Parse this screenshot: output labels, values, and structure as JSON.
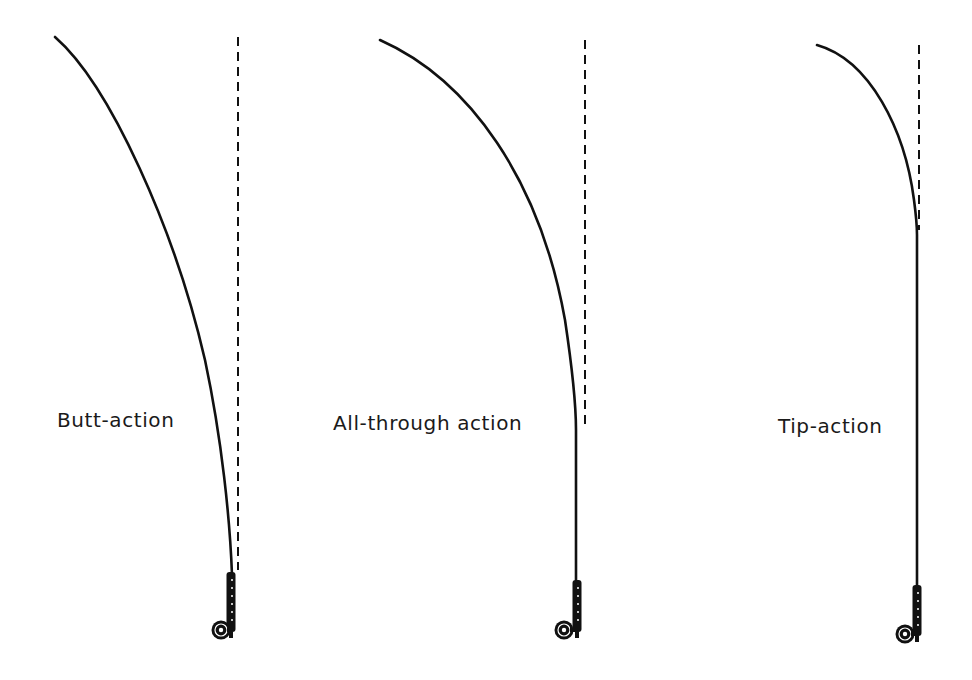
{
  "diagram": {
    "type": "fly-rod-action-comparison",
    "rods": [
      {
        "id": "butt",
        "label": "Butt-action",
        "tip": [
          55,
          37
        ],
        "curve": "M55,37 C110,85 175,230 205,360 C222,440 230,520 232,575",
        "vertical_x": 238,
        "vertical_y": [
          37,
          570
        ],
        "grip_x": 231,
        "grip_y": [
          572,
          632
        ],
        "reel": [
          221,
          630
        ],
        "label_pos": [
          57,
          408
        ]
      },
      {
        "id": "all-through",
        "label": "All-through action",
        "tip": [
          380,
          40
        ],
        "curve": "M380,40 C470,80 540,180 565,320 C574,380 576,410 576,430 L576,580",
        "vertical_x": 585,
        "vertical_y": [
          40,
          430
        ],
        "grip_x": 577,
        "grip_y": [
          580,
          632
        ],
        "reel": [
          564,
          630
        ],
        "label_pos": [
          333,
          411
        ]
      },
      {
        "id": "tip",
        "label": "Tip-action",
        "tip": [
          817,
          45
        ],
        "curve": "M817,45 C870,60 905,130 914,200 C916,215 917,225 917,235 L917,585",
        "vertical_x": 919,
        "vertical_y": [
          45,
          230
        ],
        "grip_x": 917,
        "grip_y": [
          585,
          636
        ],
        "reel": [
          905,
          634
        ],
        "label_pos": [
          778,
          414
        ]
      }
    ],
    "colors": {
      "ink": "#111111",
      "background": "#ffffff"
    }
  }
}
